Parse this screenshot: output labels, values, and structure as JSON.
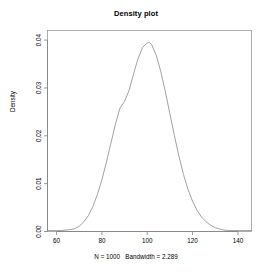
{
  "chart_data": {
    "type": "line",
    "title": "Density plot",
    "subtitle": "N = 1000   Bandwidth = 2.289",
    "xlabel": "",
    "ylabel": "Density",
    "xlim": [
      56,
      146
    ],
    "ylim": [
      0,
      0.042
    ],
    "grid": false,
    "legend": null,
    "n": 1000,
    "bandwidth": 2.289,
    "xticks": [
      60,
      80,
      100,
      120,
      140
    ],
    "xtick_labels": [
      "60",
      "80",
      "100",
      "120",
      "140"
    ],
    "yticks": [
      0.0,
      0.01,
      0.02,
      0.03,
      0.04
    ],
    "ytick_labels": [
      "0.00",
      "0.01",
      "0.02",
      "0.03",
      "0.04"
    ],
    "series": [
      {
        "name": "density",
        "x": [
          56,
          58,
          60,
          62,
          64,
          66,
          68,
          70,
          72,
          74,
          76,
          78,
          80,
          82,
          84,
          86,
          88,
          90,
          92,
          94,
          96,
          98,
          100,
          101,
          102,
          104,
          106,
          108,
          110,
          112,
          114,
          116,
          118,
          120,
          122,
          124,
          126,
          128,
          130,
          132,
          134,
          136,
          138,
          140,
          142,
          144,
          146
        ],
        "y": [
          0.0002,
          0.0002,
          0.0002,
          0.0002,
          0.0003,
          0.0004,
          0.0006,
          0.0011,
          0.002,
          0.0033,
          0.0052,
          0.0077,
          0.0108,
          0.0145,
          0.0185,
          0.0225,
          0.0258,
          0.0272,
          0.0295,
          0.033,
          0.0362,
          0.0385,
          0.0394,
          0.0395,
          0.039,
          0.0368,
          0.0334,
          0.0292,
          0.0246,
          0.02,
          0.0157,
          0.0119,
          0.0088,
          0.0063,
          0.0044,
          0.003,
          0.002,
          0.0013,
          0.0008,
          0.0005,
          0.0003,
          0.0002,
          0.0002,
          0.0002,
          0.0002,
          0.0002,
          0.0002
        ]
      }
    ]
  }
}
